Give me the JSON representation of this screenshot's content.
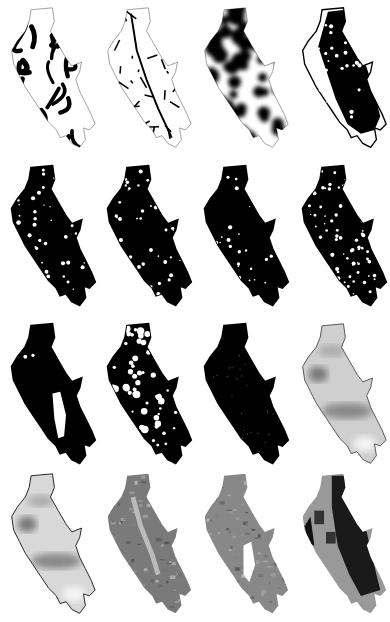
{
  "figure": {
    "layout": {
      "rows": 4,
      "cols": 4
    },
    "region_shape": "elongated-northwest-southeast-region",
    "panels": [
      {
        "row": 0,
        "col": 0,
        "style": "drainage-network",
        "fill": "#ffffff",
        "pattern": "thick-black-branches",
        "outline": "#888888"
      },
      {
        "row": 0,
        "col": 1,
        "style": "road-network",
        "fill": "#ffffff",
        "pattern": "black-line-mesh",
        "outline": "#888888"
      },
      {
        "row": 0,
        "col": 2,
        "style": "density-blobs",
        "fill": "#222222",
        "pattern": "dark-blur-with-light-gaps",
        "outline": "#888888"
      },
      {
        "row": 0,
        "col": 3,
        "style": "mostly-black-with-white-margin",
        "fill": "#111111",
        "pattern": "black-core-white-edges",
        "outline": "#000000"
      },
      {
        "row": 1,
        "col": 0,
        "style": "binary-mask",
        "fill": "#000000",
        "pattern": "white-specks-sparse",
        "outline": "#000000"
      },
      {
        "row": 1,
        "col": 1,
        "style": "binary-mask",
        "fill": "#000000",
        "pattern": "white-specks-central",
        "outline": "#000000"
      },
      {
        "row": 1,
        "col": 2,
        "style": "binary-mask",
        "fill": "#000000",
        "pattern": "white-specks-few",
        "outline": "#000000"
      },
      {
        "row": 1,
        "col": 3,
        "style": "binary-mask",
        "fill": "#000000",
        "pattern": "white-specks-dense",
        "outline": "#000000"
      },
      {
        "row": 2,
        "col": 0,
        "style": "binary-mask",
        "fill": "#000000",
        "pattern": "white-lake-south",
        "outline": "#000000"
      },
      {
        "row": 2,
        "col": 1,
        "style": "binary-mask",
        "fill": "#000000",
        "pattern": "white-patches-many",
        "outline": "#000000"
      },
      {
        "row": 2,
        "col": 2,
        "style": "binary-mask",
        "fill": "#000000",
        "pattern": "tiny-grey-dots",
        "outline": "#000000"
      },
      {
        "row": 2,
        "col": 3,
        "style": "interpolated-surface",
        "fill": "#cfcfcf",
        "pattern": "grey-gradient-bands",
        "outline": "#555555"
      },
      {
        "row": 3,
        "col": 0,
        "style": "interpolated-surface",
        "fill": "#d8d8d8",
        "pattern": "grey-gradient-bands",
        "outline": "#222222"
      },
      {
        "row": 3,
        "col": 1,
        "style": "terrain-texture",
        "fill": "#7a7a7a",
        "pattern": "grey-relief-light-valley",
        "outline": "#666666"
      },
      {
        "row": 3,
        "col": 2,
        "style": "terrain-texture",
        "fill": "#888888",
        "pattern": "grey-relief-white-lake",
        "outline": "#777777"
      },
      {
        "row": 3,
        "col": 3,
        "style": "classified-surface",
        "fill": "#333333",
        "pattern": "dark-with-grey-patches",
        "outline": "#444444"
      }
    ]
  }
}
